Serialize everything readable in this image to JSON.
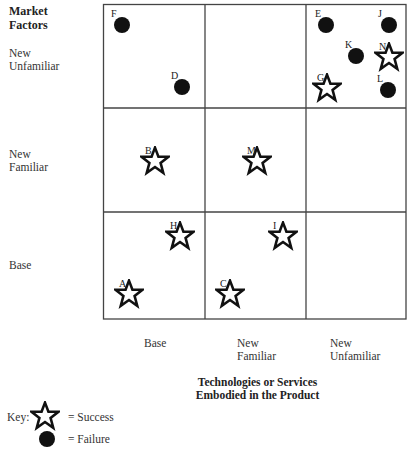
{
  "chart_data": {
    "type": "matrix-scatter",
    "y_axis_title": [
      "Market",
      "Factors"
    ],
    "x_axis_title": [
      "Technologies or Services",
      "Embodied in the Product"
    ],
    "rows": [
      {
        "label": [
          "New",
          "Unfamiliar"
        ]
      },
      {
        "label": [
          "New",
          "Familiar"
        ]
      },
      {
        "label": [
          "Base"
        ]
      }
    ],
    "columns": [
      {
        "label": [
          "Base"
        ]
      },
      {
        "label": [
          "New",
          "Familiar"
        ]
      },
      {
        "label": [
          "New",
          "Unfamiliar"
        ]
      }
    ],
    "points": [
      {
        "id": "F",
        "type": "failure",
        "row": "New Unfamiliar",
        "col": "Base",
        "x": 122,
        "y": 25
      },
      {
        "id": "D",
        "type": "failure",
        "row": "New Unfamiliar",
        "col": "Base",
        "x": 182,
        "y": 87
      },
      {
        "id": "E",
        "type": "failure",
        "row": "New Unfamiliar",
        "col": "New Unfamiliar",
        "x": 326,
        "y": 25
      },
      {
        "id": "J",
        "type": "failure",
        "row": "New Unfamiliar",
        "col": "New Unfamiliar",
        "x": 389,
        "y": 25
      },
      {
        "id": "K",
        "type": "failure",
        "row": "New Unfamiliar",
        "col": "New Unfamiliar",
        "x": 356,
        "y": 56
      },
      {
        "id": "N",
        "type": "success",
        "row": "New Unfamiliar",
        "col": "New Unfamiliar",
        "x": 389,
        "y": 57
      },
      {
        "id": "G",
        "type": "success",
        "row": "New Unfamiliar",
        "col": "New Unfamiliar",
        "x": 327,
        "y": 88
      },
      {
        "id": "L",
        "type": "failure",
        "row": "New Unfamiliar",
        "col": "New Unfamiliar",
        "x": 388,
        "y": 90
      },
      {
        "id": "B",
        "type": "success",
        "row": "New Familiar",
        "col": "Base",
        "x": 155,
        "y": 161
      },
      {
        "id": "M",
        "type": "success",
        "row": "New Familiar",
        "col": "New Familiar",
        "x": 257,
        "y": 161
      },
      {
        "id": "H",
        "type": "success",
        "row": "Base",
        "col": "Base",
        "x": 180,
        "y": 236
      },
      {
        "id": "I",
        "type": "success",
        "row": "Base",
        "col": "New Familiar",
        "x": 283,
        "y": 236
      },
      {
        "id": "A",
        "type": "success",
        "row": "Base",
        "col": "Base",
        "x": 129,
        "y": 294
      },
      {
        "id": "C",
        "type": "success",
        "row": "Base",
        "col": "New Familiar",
        "x": 230,
        "y": 294
      }
    ],
    "legend": [
      {
        "symbol": "star",
        "label": "= Success"
      },
      {
        "symbol": "circle",
        "label": "= Failure"
      }
    ]
  },
  "labels": {
    "y_title_1": "Market",
    "y_title_2": "Factors",
    "row1_a": "New",
    "row1_b": "Unfamiliar",
    "row2_a": "New",
    "row2_b": "Familiar",
    "row3_a": "Base",
    "col1_a": "Base",
    "col2_a": "New",
    "col2_b": "Familiar",
    "col3_a": "New",
    "col3_b": "Unfamiliar",
    "x_title_1": "Technologies or Services",
    "x_title_2": "Embodied in the Product",
    "key": "Key:",
    "success": "= Success",
    "failure": "= Failure"
  }
}
